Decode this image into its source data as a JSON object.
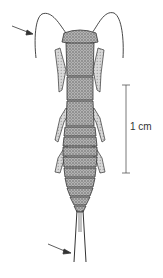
{
  "figure": {
    "scale_bar": {
      "label": "1 cm"
    },
    "annotations": [
      {
        "name": "antenna-arrow",
        "points_to": "antenna"
      },
      {
        "name": "cerci-arrow",
        "points_to": "cerci"
      }
    ],
    "colors": {
      "ink": "#333333",
      "stipple": "#8a8a8a",
      "background": "#ffffff"
    }
  }
}
